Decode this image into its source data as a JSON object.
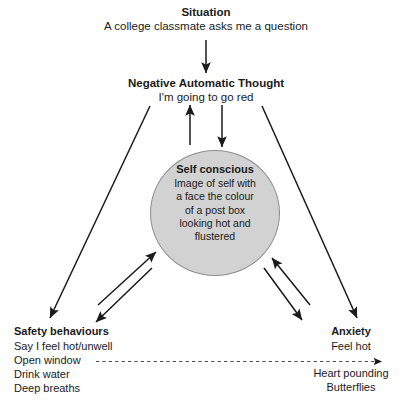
{
  "diagram": {
    "title_text": "Cognitive model of social anxiety",
    "situation": {
      "heading": "Situation",
      "detail": "A college classmate asks me a question"
    },
    "negative_automatic_thought": {
      "heading": "Negative Automatic Thought",
      "detail": "I'm going to go red"
    },
    "self_image": {
      "heading": "Self conscious",
      "lines": [
        "Image of self with",
        "a face the colour",
        "of a post box",
        "looking hot and",
        "flustered"
      ]
    },
    "safety_behaviours": {
      "heading": "Safety behaviours",
      "items": [
        "Say I feel hot/unwell",
        "Open window",
        "Drink water",
        "Deep breaths"
      ]
    },
    "anxiety": {
      "heading": "Anxiety",
      "detail": "Feel hot"
    },
    "physical_symptoms": {
      "items": [
        "Heart pounding",
        "Butterflies"
      ]
    },
    "colors": {
      "ellipse_fill": "#d2d2d2",
      "ellipse_stroke": "#8e8e8e",
      "ink": "#1a1a1a",
      "background": "#ffffff"
    },
    "connectors": [
      {
        "name": "situation-to-thought",
        "style": "solid",
        "arrow": "end"
      },
      {
        "name": "thought-to-safety-behaviours",
        "style": "solid",
        "arrow": "end"
      },
      {
        "name": "thought-to-anxiety",
        "style": "solid",
        "arrow": "end"
      },
      {
        "name": "thought-to-self-image",
        "style": "solid",
        "arrow": "end"
      },
      {
        "name": "self-image-to-thought",
        "style": "solid",
        "arrow": "end"
      },
      {
        "name": "self-image-to-safety-behaviours",
        "style": "solid",
        "arrow": "end"
      },
      {
        "name": "safety-behaviours-to-self-image",
        "style": "solid",
        "arrow": "end"
      },
      {
        "name": "self-image-to-anxiety",
        "style": "solid",
        "arrow": "end"
      },
      {
        "name": "anxiety-to-self-image",
        "style": "solid",
        "arrow": "end"
      },
      {
        "name": "safety-behaviours-to-anxiety-dashed",
        "style": "dashed",
        "arrow": "end"
      }
    ]
  }
}
